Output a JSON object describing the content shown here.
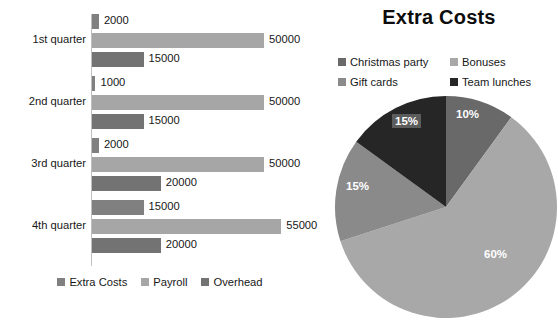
{
  "colors": {
    "extra_costs": "#808080",
    "payroll": "#a6a6a6",
    "overhead": "#737373",
    "christmas_party": "#696969",
    "bonuses": "#a8a8a8",
    "gift_cards": "#8a8a8a",
    "team_lunches": "#262626",
    "axis": "#bfbfbf",
    "text": "#171717",
    "background": "#ffffff"
  },
  "bar_chart": {
    "name": "quarterly-costs-bar-chart",
    "legend": [
      {
        "label": "Extra Costs",
        "color": "#808080"
      },
      {
        "label": "Payroll",
        "color": "#a6a6a6"
      },
      {
        "label": "Overhead",
        "color": "#737373"
      }
    ]
  },
  "pie_chart": {
    "name": "extra-costs-pie-chart",
    "title": "Extra Costs",
    "legend_rows": [
      [
        {
          "label": "Christmas party",
          "color": "#696969"
        },
        {
          "label": "Bonuses",
          "color": "#a8a8a8"
        }
      ],
      [
        {
          "label": "Gift cards",
          "color": "#8a8a8a"
        },
        {
          "label": "Team lunches",
          "color": "#262626"
        }
      ]
    ]
  },
  "chart_data": [
    {
      "type": "bar",
      "orientation": "horizontal",
      "title": "",
      "xlabel": "",
      "ylabel": "",
      "categories": [
        "1st quarter",
        "2nd quarter",
        "3rd quarter",
        "4th quarter"
      ],
      "series": [
        {
          "name": "Extra Costs",
          "color": "#808080",
          "values": [
            2000,
            1000,
            2000,
            15000
          ]
        },
        {
          "name": "Payroll",
          "color": "#a6a6a6",
          "values": [
            50000,
            50000,
            50000,
            55000
          ]
        },
        {
          "name": "Overhead",
          "color": "#737373",
          "values": [
            15000,
            15000,
            20000,
            20000
          ]
        }
      ],
      "data_labels": [
        [
          "2000",
          "50000",
          "15000"
        ],
        [
          "1000",
          "50000",
          "15000"
        ],
        [
          "2000",
          "50000",
          "20000"
        ],
        [
          "15000",
          "55000",
          "20000"
        ]
      ],
      "xlim": [
        0,
        55000
      ],
      "grid": false,
      "legend_position": "bottom"
    },
    {
      "type": "pie",
      "title": "Extra Costs",
      "labels": [
        "Christmas party",
        "Bonuses",
        "Gift cards",
        "Team lunches"
      ],
      "values": [
        10,
        60,
        15,
        15
      ],
      "value_labels": [
        "10%",
        "60%",
        "15%",
        "15%"
      ],
      "colors": [
        "#696969",
        "#a8a8a8",
        "#8a8a8a",
        "#262626"
      ],
      "start_angle_deg": 0,
      "direction": "clockwise",
      "legend_position": "top"
    }
  ]
}
